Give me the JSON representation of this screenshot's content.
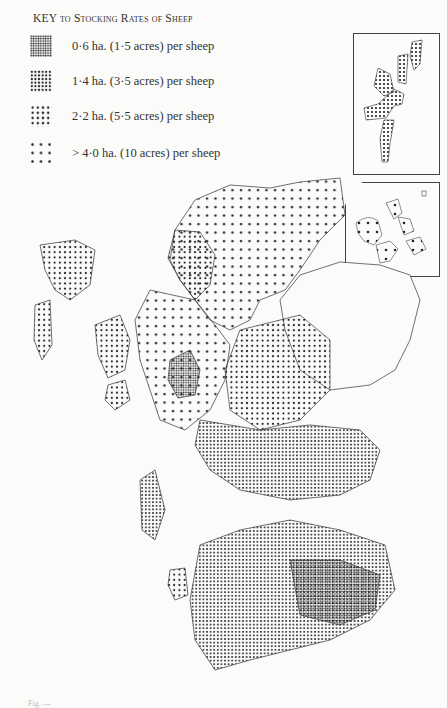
{
  "key": {
    "title_prefix": "KEY",
    "title_rest": "to Stocking Rates of Sheep",
    "items": [
      {
        "label": "0·6 ha. (1·5 acres) per sheep",
        "density": "very-dense",
        "dot_spacing": 2.4
      },
      {
        "label": "1·4 ha. (3·5 acres) per sheep",
        "density": "dense",
        "dot_spacing": 3.6
      },
      {
        "label": "2·2 ha. (5·5 acres) per sheep",
        "density": "medium",
        "dot_spacing": 5.2
      },
      {
        "label": "> 4·0 ha. (10 acres) per sheep",
        "density": "sparse",
        "dot_spacing": 8.5
      }
    ]
  },
  "map": {
    "subject": "Scotland — sheep stocking rates by parish",
    "insets": [
      {
        "name": "Shetland",
        "fill": "dense"
      },
      {
        "name": "Orkney",
        "fill": "sparse"
      }
    ],
    "colors": {
      "ink": "#222222",
      "paper": "#fbfbf9"
    }
  },
  "caption": "Fig. —"
}
